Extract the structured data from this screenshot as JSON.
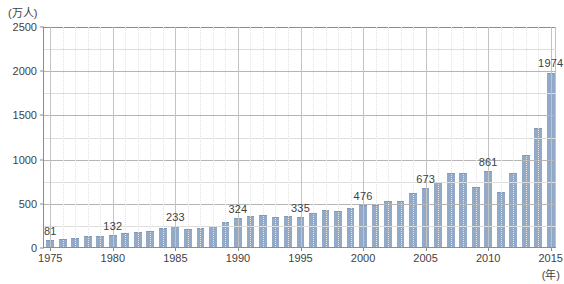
{
  "chart_data": {
    "type": "bar",
    "title": "",
    "subtitle": "",
    "xlabel": "(年)",
    "ylabel": "(万人)",
    "ylim": [
      0,
      2500
    ],
    "y_major_step": 500,
    "y_minor_step": 250,
    "y_ticks": [
      "0",
      "500",
      "1000",
      "1500",
      "2000",
      "2500"
    ],
    "x_ticks": [
      "1975",
      "1980",
      "1985",
      "1990",
      "1995",
      "2000",
      "2005",
      "2010",
      "2015"
    ],
    "xlim": [
      1975,
      2015
    ],
    "grid": "both",
    "legend": "none",
    "bar_color": "#93a9c8",
    "categories": [
      "1975",
      "1976",
      "1977",
      "1978",
      "1979",
      "1980",
      "1981",
      "1982",
      "1983",
      "1984",
      "1985",
      "1986",
      "1987",
      "1988",
      "1989",
      "1990",
      "1991",
      "1992",
      "1993",
      "1994",
      "1995",
      "1996",
      "1997",
      "1998",
      "1999",
      "2000",
      "2001",
      "2002",
      "2003",
      "2004",
      "2005",
      "2006",
      "2007",
      "2008",
      "2009",
      "2010",
      "2011",
      "2012",
      "2013",
      "2014",
      "2015"
    ],
    "values": [
      81,
      91,
      103,
      124,
      127,
      132,
      154,
      166,
      182,
      213,
      233,
      206,
      216,
      236,
      284,
      324,
      353,
      358,
      341,
      346,
      335,
      384,
      422,
      411,
      444,
      476,
      477,
      524,
      521,
      614,
      673,
      733,
      835,
      835,
      679,
      861,
      622,
      836,
      1036,
      1341,
      1974
    ],
    "annotations": [
      {
        "year": "1975",
        "value": 81,
        "label": "81"
      },
      {
        "year": "1980",
        "value": 132,
        "label": "132"
      },
      {
        "year": "1985",
        "value": 233,
        "label": "233"
      },
      {
        "year": "1990",
        "value": 324,
        "label": "324"
      },
      {
        "year": "1995",
        "value": 335,
        "label": "335"
      },
      {
        "year": "2000",
        "value": 476,
        "label": "476"
      },
      {
        "year": "2005",
        "value": 673,
        "label": "673"
      },
      {
        "year": "2010",
        "value": 861,
        "label": "861"
      },
      {
        "year": "2015",
        "value": 1974,
        "label": "1974"
      }
    ]
  }
}
